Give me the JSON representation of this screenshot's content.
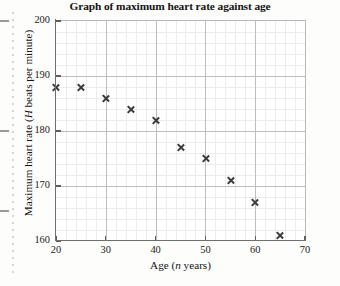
{
  "chart_data": {
    "type": "scatter",
    "title": "Graph of maximum heart rate against age",
    "xlabel_prefix": "Age (",
    "xlabel_italic": "n",
    "xlabel_suffix": " years)",
    "ylabel_prefix": "Maximum heart rate (",
    "ylabel_italic": "H",
    "ylabel_suffix": " beats per minute)",
    "xlabel": "Age (n years)",
    "ylabel": "Maximum heart rate (H beats per minute)",
    "xlim": [
      20,
      70
    ],
    "ylim": [
      160,
      200
    ],
    "xticks": [
      20,
      30,
      40,
      50,
      60,
      70
    ],
    "yticks": [
      160,
      170,
      180,
      190,
      200
    ],
    "x_minor_step": 2,
    "y_minor_step": 2,
    "grid": true,
    "legend": null,
    "marker": "x-cross",
    "marker_color": "#3a3a3a",
    "x": [
      20,
      25,
      30,
      35,
      40,
      45,
      50,
      55,
      60,
      65
    ],
    "y": [
      188,
      188,
      186,
      184,
      182,
      177,
      175,
      171,
      167,
      161
    ],
    "points": [
      {
        "x": 20,
        "y": 188
      },
      {
        "x": 25,
        "y": 188
      },
      {
        "x": 30,
        "y": 186
      },
      {
        "x": 35,
        "y": 184
      },
      {
        "x": 40,
        "y": 182
      },
      {
        "x": 45,
        "y": 177
      },
      {
        "x": 50,
        "y": 175
      },
      {
        "x": 55,
        "y": 171
      },
      {
        "x": 60,
        "y": 167
      },
      {
        "x": 65,
        "y": 161
      }
    ]
  },
  "colors": {
    "axis": "#6f6f6f",
    "grid_major": "#bdbdbd",
    "grid_minor": "#ececec",
    "text": "#141414",
    "page_background": "#fdfdfc",
    "plot_background": "#ffffff"
  }
}
